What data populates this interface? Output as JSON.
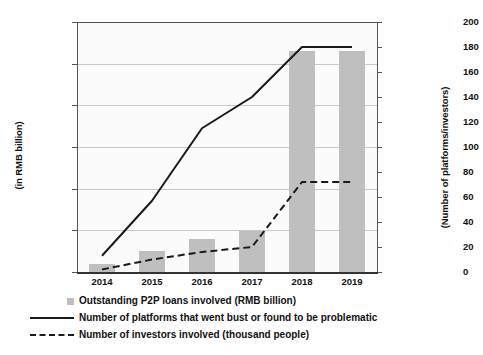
{
  "chart_data": {
    "type": "bar",
    "title": "",
    "subtitle": "",
    "xlabel": "",
    "ylabel": "(in RMB billion)",
    "y2label": "(Number of platforms/investors)",
    "categories": [
      "2014",
      "2015",
      "2016",
      "2017",
      "2018",
      "2019"
    ],
    "grid": true,
    "legend_position": "bottom-left",
    "ylim": [
      0,
      6000
    ],
    "y2lim": [
      0,
      200
    ],
    "yticks": [
      "0",
      "1,000",
      "2,000",
      "3,000",
      "4,000",
      "5,000",
      "6,000"
    ],
    "ytick_values": [
      0,
      1000,
      2000,
      3000,
      4000,
      5000,
      6000
    ],
    "y2ticks": [
      "0",
      "20",
      "40",
      "60",
      "80",
      "100",
      "120",
      "140",
      "160",
      "180",
      "200"
    ],
    "y2tick_values": [
      0,
      20,
      40,
      60,
      80,
      100,
      120,
      140,
      160,
      180,
      200
    ],
    "series": [
      {
        "name": "Outstanding P2P loans involved (RMB billion)",
        "type": "bar",
        "axis": "left",
        "color": "#bfbfbf",
        "values": [
          200,
          500,
          800,
          980,
          5300,
          5300
        ]
      },
      {
        "name": "Number of platforms that went bust or found to be problematic",
        "type": "line",
        "style": "solid",
        "axis": "right",
        "color": "#1a1a1a",
        "values": [
          13,
          57,
          115,
          140,
          180,
          180
        ]
      },
      {
        "name": "Number of investors involved (thousand people)",
        "type": "line",
        "style": "dashed",
        "axis": "right",
        "color": "#1a1a1a",
        "values": [
          2,
          10,
          16,
          20,
          72,
          72
        ]
      }
    ]
  },
  "legend": {
    "items": [
      {
        "label": "Outstanding P2P loans involved (RMB billion)",
        "marker": "square-gray"
      },
      {
        "label": "Number of platforms that went bust or found to be problematic",
        "marker": "line-solid"
      },
      {
        "label": "Number of investors involved (thousand people)",
        "marker": "line-dashed"
      }
    ]
  }
}
